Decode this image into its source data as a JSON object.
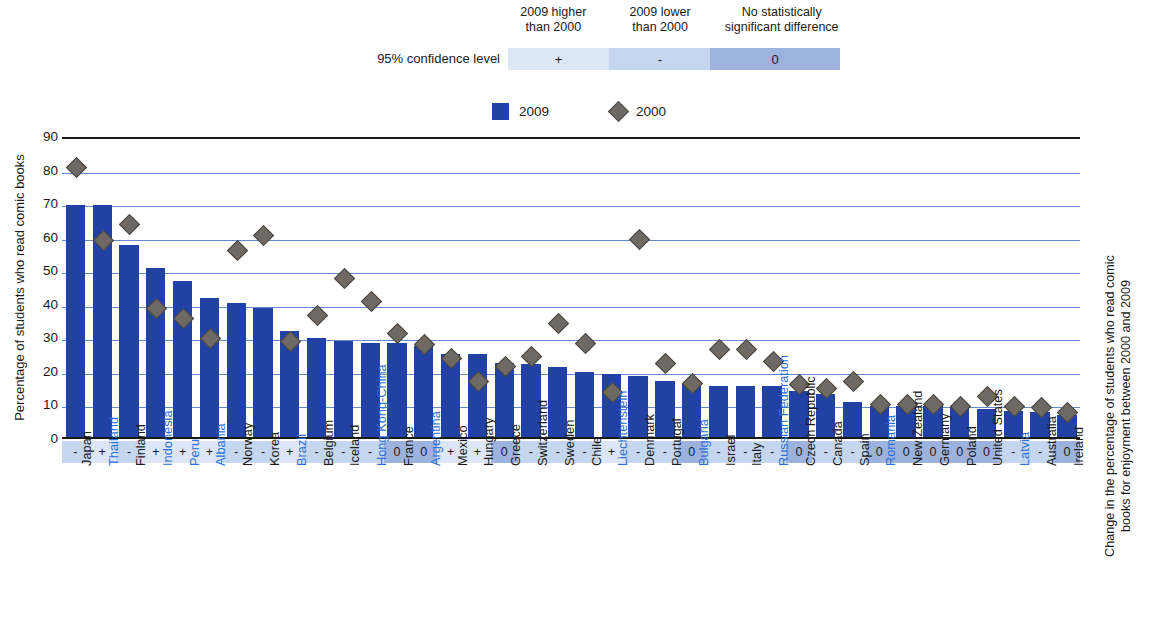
{
  "confidence_legend": {
    "row_label": "95% confidence level",
    "headers": [
      "2009 higher\nthan 2000",
      "2009 lower\nthan 2000",
      "No statistically\nsignificant difference"
    ],
    "symbols": [
      "+",
      "-",
      "0"
    ],
    "colors": [
      "#dce6f5",
      "#c5d6ef",
      "#9db3dd"
    ]
  },
  "series_legend": [
    {
      "label": "2009",
      "marker": "square",
      "color": "#2241a5"
    },
    {
      "label": "2000",
      "marker": "diamond",
      "color": "#6e6a63"
    }
  ],
  "axis": {
    "y_left_title": "Percentage of students who read comic books",
    "y_right_title": "Change in the percentage of students who read comic books for enjoyment between 2000 and 2009",
    "y_ticks": [
      0,
      10,
      20,
      30,
      40,
      50,
      60,
      70,
      80,
      90
    ],
    "y_min": 0,
    "y_max": 90
  },
  "chart_data": {
    "type": "bar",
    "title": "",
    "xlabel": "",
    "ylabel": "Percentage of students who read comic books",
    "ylim": [
      0,
      90
    ],
    "grid": true,
    "legend_position": "top-center",
    "categories": [
      "Japan",
      "Thailand",
      "Finland",
      "Indonesia",
      "Peru",
      "Albania",
      "Norway",
      "Korea",
      "Brazil",
      "Belgium",
      "Iceland",
      "Hong Kong-China",
      "France",
      "Argentina",
      "Mexico",
      "Hungary",
      "Greece",
      "Switzerland",
      "Sweden",
      "Chile",
      "Liechtenstein",
      "Denmark",
      "Portugal",
      "Bulgaria",
      "Israel",
      "Italy",
      "Russian Federation",
      "Czech Republic",
      "Canada",
      "Spain",
      "Romania",
      "New Zealand",
      "Germany",
      "Poland",
      "United States",
      "Latvia",
      "Australia",
      "Ireland"
    ],
    "series": [
      {
        "name": "2009",
        "color": "#2241a5",
        "values": [
          70,
          70,
          58,
          51,
          47,
          42,
          40.5,
          39,
          32,
          30,
          29,
          28.5,
          28.5,
          27.5,
          25,
          25,
          22.5,
          22,
          21,
          19.5,
          19,
          18.5,
          17,
          16,
          15.5,
          15.5,
          15.5,
          14,
          13,
          10.5,
          9.5,
          9.5,
          9.5,
          9,
          8.5,
          8,
          7.5,
          6.5
        ]
      },
      {
        "name": "2000",
        "color": "#6e6a63",
        "values": [
          81,
          59,
          64,
          38.5,
          35.5,
          29.5,
          56,
          60.5,
          28.5,
          36.5,
          47.5,
          40.5,
          31,
          27.5,
          23.5,
          16.5,
          21,
          24,
          34,
          28,
          13,
          59.5,
          22,
          16,
          26,
          26,
          22.5,
          15.5,
          14.5,
          16.5,
          9.5,
          9.5,
          9.5,
          9,
          12,
          9,
          8.5,
          7
        ]
      }
    ],
    "significance": [
      "-",
      "+",
      "-",
      "+",
      "+",
      "+",
      "-",
      "-",
      "+",
      "-",
      "-",
      "-",
      "0",
      "0",
      "+",
      "+",
      "0",
      "-",
      "-",
      "-",
      "+",
      "-",
      "-",
      "0",
      "-",
      "-",
      "-",
      "0",
      "-",
      "-",
      "0",
      "0",
      "0",
      "0",
      "0",
      "-",
      "-",
      "0"
    ],
    "highlighted_categories": [
      "Thailand",
      "Indonesia",
      "Peru",
      "Albania",
      "Brazil",
      "Hong Kong-China",
      "Argentina",
      "Liechtenstein",
      "Bulgaria",
      "Russian Federation",
      "Romania",
      "Latvia"
    ]
  }
}
